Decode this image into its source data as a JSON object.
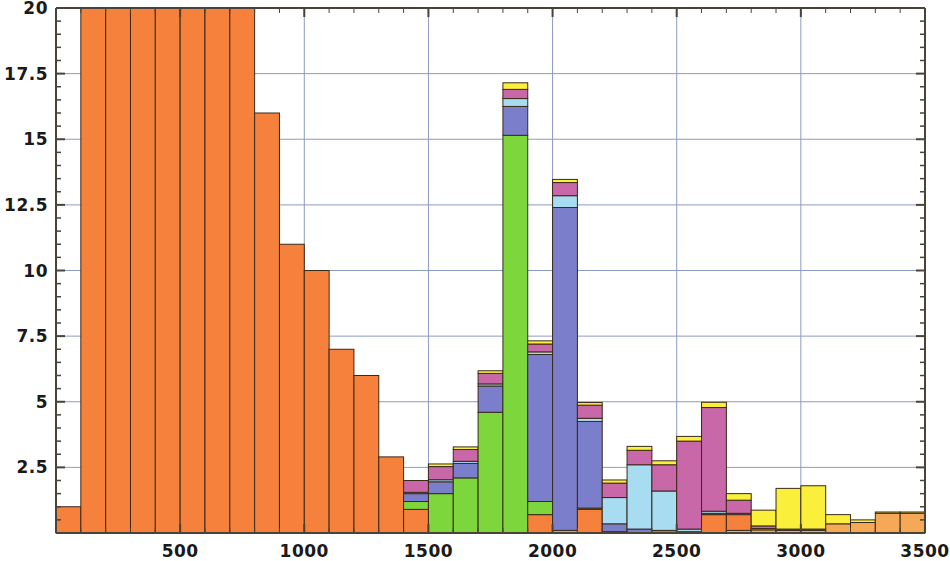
{
  "chart_data": {
    "type": "bar",
    "subtype": "stacked-histogram",
    "title": "",
    "xlabel": "",
    "ylabel": "",
    "xlim": [
      0,
      3500
    ],
    "ylim": [
      0,
      20
    ],
    "bin_width": 100,
    "grid": true,
    "grid_color": "#8C9BC4",
    "axis_color": "#4A4438",
    "bar_edge_color": "#3A2A18",
    "legend": "none",
    "xticks": [
      500,
      1000,
      1500,
      2000,
      2500,
      3000,
      3500
    ],
    "xtick_labels": [
      "500",
      "1000",
      "1500",
      "2000",
      "2500",
      "3000",
      "3500"
    ],
    "yticks": [
      2.5,
      5,
      7.5,
      10,
      12.5,
      15,
      17.5,
      20
    ],
    "ytick_labels": [
      "2.5",
      "5",
      "7.5",
      "10",
      "12.5",
      "15",
      "17.5",
      "20"
    ],
    "y_minor_tick_step": 0.5,
    "x_minor_tick_step": 100,
    "bin_starts": [
      0,
      100,
      200,
      300,
      400,
      500,
      600,
      700,
      800,
      900,
      1000,
      1100,
      1200,
      1300,
      1400,
      1500,
      1600,
      1700,
      1800,
      1900,
      2000,
      2100,
      2200,
      2300,
      2400,
      2500,
      2600,
      2700,
      2800,
      2900,
      3000,
      3100,
      3200,
      3300,
      3400
    ],
    "series": [
      {
        "name": "series-yellow",
        "color": "#FAF03C",
        "values": [
          0,
          0,
          0,
          0,
          0,
          0,
          0,
          0,
          0,
          0,
          0,
          0,
          0,
          0,
          0,
          0.1,
          0.1,
          0.1,
          0.25,
          0.12,
          0.12,
          0.1,
          0.12,
          0.15,
          0.15,
          0.18,
          0.2,
          0.25,
          0.6,
          1.55,
          1.65,
          0.35,
          0.1,
          0.05,
          0.05
        ]
      },
      {
        "name": "series-magenta",
        "color": "#C868A8",
        "values": [
          0,
          0,
          0,
          0,
          0,
          0,
          0,
          0,
          0,
          0,
          0,
          0,
          0,
          0,
          0.45,
          0.5,
          0.45,
          0.4,
          0.35,
          0.3,
          0.5,
          0.5,
          0.55,
          0.55,
          1.0,
          3.35,
          3.95,
          0.5,
          0.1,
          0.05,
          0.05,
          0,
          0,
          0,
          0
        ]
      },
      {
        "name": "series-lightblue",
        "color": "#A8DCF0",
        "values": [
          0,
          0,
          0,
          0,
          0,
          0,
          0,
          0,
          0,
          0,
          0,
          0,
          0,
          0,
          0.05,
          0.08,
          0.08,
          0.08,
          0.3,
          0.1,
          0.45,
          0.12,
          1.0,
          2.45,
          1.5,
          0.1,
          0.08,
          0.05,
          0.05,
          0,
          0,
          0,
          0,
          0,
          0
        ]
      },
      {
        "name": "series-purple",
        "color": "#7B7FCB",
        "values": [
          0,
          0,
          0,
          0,
          0,
          0,
          0,
          0,
          0,
          0,
          0,
          0,
          0,
          0,
          0.3,
          0.45,
          0.55,
          1.0,
          1.1,
          5.6,
          12.3,
          3.3,
          0.3,
          0.15,
          0.1,
          0.05,
          0.05,
          0,
          0,
          0,
          0,
          0,
          0,
          0,
          0
        ]
      },
      {
        "name": "series-green",
        "color": "#7DD63C",
        "values": [
          0,
          0,
          0,
          0,
          0,
          0,
          0,
          0,
          0,
          0,
          0,
          0,
          0,
          0,
          0.3,
          1.5,
          2.1,
          4.6,
          15.15,
          0.5,
          0.1,
          0.05,
          0.05,
          0,
          0,
          0,
          0,
          0,
          0,
          0,
          0,
          0,
          0,
          0,
          0
        ]
      },
      {
        "name": "series-orange",
        "color": "#F5813C",
        "values": [
          1.0,
          20.5,
          20.5,
          20.5,
          20.5,
          20.5,
          20.5,
          20.5,
          16.0,
          11.0,
          10.0,
          7.0,
          6.0,
          2.9,
          0.9,
          0,
          0,
          0,
          0,
          0.7,
          0,
          0.9,
          0,
          0,
          0,
          0,
          0.7,
          0.6,
          0,
          0,
          0,
          0,
          0,
          0,
          0
        ]
      },
      {
        "name": "series-lightorange",
        "color": "#F5A855",
        "values": [
          0,
          0,
          0,
          0,
          0,
          0,
          0,
          0,
          0,
          0,
          0,
          0,
          0,
          0,
          0,
          0,
          0,
          0,
          0,
          0,
          0,
          0,
          0,
          0,
          0,
          0,
          0,
          0.1,
          0.12,
          0.1,
          0.1,
          0.35,
          0.4,
          0.75,
          0.75
        ]
      }
    ]
  },
  "axes": {
    "y_label_positions": {
      "20": 8,
      "17.5": 74,
      "15": 140,
      "12.5": 206,
      "10": 271,
      "7.5": 337,
      "5": 403,
      "2.5": 468
    }
  }
}
